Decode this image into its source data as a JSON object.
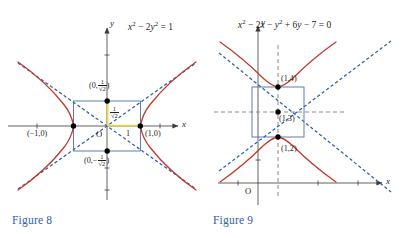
{
  "page": {
    "width": 403,
    "height": 238,
    "background": "#ffffff"
  },
  "colors": {
    "curve_red": "#c0392b",
    "asymptote_blue": "#2f5fa8",
    "rectangle_blue": "#4a6fa8",
    "caption_blue": "#2f5fa8",
    "unit_yellow": "#e8d44d",
    "axis_black": "#3a3a3a",
    "helper_gray": "#8a8a8a",
    "point_black": "#000000",
    "text_black": "#231f20"
  },
  "figures": [
    {
      "id": "figure-8",
      "caption": "Figure 8",
      "equation_plain": "x² − 2y² = 1",
      "axis_x_label": "x",
      "axis_y_label": "y",
      "origin_label": "O",
      "labels": {
        "vertex_left": "(−1,0)",
        "vertex_right": "(1,0)",
        "unit_x": "1",
        "co_vertex_top_prefix": "(0,",
        "co_vertex_top_frac_num": "1",
        "co_vertex_top_frac_den": "√2",
        "co_vertex_top_suffix": ")",
        "co_vertex_bottom_prefix": "(0,−",
        "co_vertex_bottom_frac_num": "1",
        "co_vertex_bottom_frac_den": "√2",
        "co_vertex_bottom_suffix": ")",
        "side_frac_num": "1",
        "side_frac_den": "√2"
      },
      "points": [
        {
          "name": "vertex-left",
          "x": -1,
          "y": 0
        },
        {
          "name": "vertex-right",
          "x": 1,
          "y": 0
        },
        {
          "name": "co-vertex-top",
          "x": 0,
          "y": 0.7071
        },
        {
          "name": "co-vertex-bottom",
          "x": 0,
          "y": -0.7071
        }
      ],
      "hyperbola": {
        "a": 1,
        "b": 0.7071,
        "orientation": "horizontal",
        "center": [
          0,
          0
        ]
      },
      "asymptote_slopes": [
        0.7071,
        -0.7071
      ],
      "box": {
        "x_half_width": 1,
        "y_half_height": 0.7071
      }
    },
    {
      "id": "figure-9",
      "caption": "Figure 9",
      "equation_plain": "x² − 2x − y² + 6y − 7 = 0",
      "axis_x_label": "x",
      "axis_y_label": "y",
      "origin_label": "O",
      "labels": {
        "vertex_top": "(1,4)",
        "center": "(1,3)",
        "vertex_bottom": "(1,2)"
      },
      "points": [
        {
          "name": "vertex-top",
          "x": 1,
          "y": 4
        },
        {
          "name": "center",
          "x": 1,
          "y": 3
        },
        {
          "name": "vertex-bottom",
          "x": 1,
          "y": 2
        }
      ],
      "hyperbola": {
        "a": 1,
        "b": 1,
        "orientation": "vertical",
        "center": [
          1,
          3
        ]
      },
      "asymptote_slopes": [
        1,
        -1
      ],
      "box": {
        "x_half_width": 1,
        "y_half_height": 1
      }
    }
  ],
  "equation_parts": {
    "fig8": [
      {
        "t": "x",
        "i": true
      },
      {
        "t": "2",
        "sup": true
      },
      {
        "t": " − 2"
      },
      {
        "t": "y",
        "i": true
      },
      {
        "t": "2",
        "sup": true
      },
      {
        "t": " = 1"
      }
    ],
    "fig9": [
      {
        "t": "x",
        "i": true
      },
      {
        "t": "2",
        "sup": true
      },
      {
        "t": " − 2"
      },
      {
        "t": "x",
        "i": true
      },
      {
        "t": " − "
      },
      {
        "t": "y",
        "i": true
      },
      {
        "t": "2",
        "sup": true
      },
      {
        "t": " + 6"
      },
      {
        "t": "y",
        "i": true
      },
      {
        "t": " − 7 = 0"
      }
    ]
  }
}
